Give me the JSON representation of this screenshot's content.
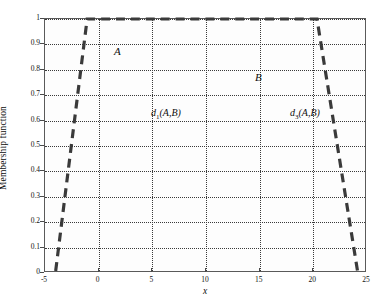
{
  "chart_data": {
    "type": "line",
    "title": "",
    "xlabel": "x",
    "ylabel": "Membership function",
    "xlim": [
      -5,
      25
    ],
    "ylim": [
      0,
      1
    ],
    "xticks": [
      "-5",
      "0",
      "5",
      "10",
      "15",
      "20",
      "25"
    ],
    "xtick_values": [
      -5,
      0,
      5,
      10,
      15,
      20,
      25
    ],
    "yticks": [
      "0",
      "0.1",
      "0.2",
      "0.3",
      "0.4",
      "0.5",
      "0.6",
      "0.7",
      "0.8",
      "0.9",
      "1"
    ],
    "ytick_values": [
      0,
      0.1,
      0.2,
      0.3,
      0.4,
      0.5,
      0.6,
      0.7,
      0.8,
      0.9,
      1
    ],
    "grid": true,
    "grid_style": "dotted",
    "grid_color": "#3a3a3a",
    "legend": "none",
    "line_color": "#3a3a3a",
    "line_style": "dashed",
    "series": [
      {
        "name": "membership",
        "style": "dashed",
        "x": [
          -4.0,
          -1.05,
          20.5,
          24.3
        ],
        "values": [
          0,
          1,
          1,
          0
        ]
      }
    ],
    "annotations": [
      {
        "id": "A",
        "text": "A",
        "x": -2.6,
        "y": 0.955
      },
      {
        "id": "B",
        "text": "B",
        "x": 10.6,
        "y": 0.855
      },
      {
        "id": "d1",
        "text": "d",
        "subscript": "1",
        "suffix": "(A,B)",
        "x": 1.5,
        "y": 0.7
      },
      {
        "id": "d3",
        "text": "d",
        "subscript": "3",
        "suffix": "(A,B)",
        "x": 14.5,
        "y": 0.7
      }
    ]
  },
  "axis": {
    "ylabel": "Membership function",
    "xlabel": "x"
  },
  "annotations": {
    "A": "A",
    "B": "B",
    "d1_base": "d",
    "d1_sub": "1",
    "d1_args": "(A,B)",
    "d3_base": "d",
    "d3_sub": "3",
    "d3_args": "(A,B)"
  }
}
